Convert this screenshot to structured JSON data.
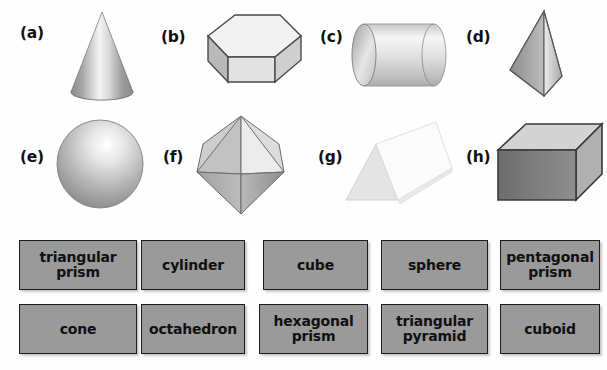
{
  "page": {
    "type": "geometry-worksheet",
    "background_color": "#fefefe",
    "title": ""
  },
  "shapes": {
    "row1": [
      {
        "letter": "(a)",
        "icon": "cone-icon",
        "shape_name": "cone",
        "shading": "vertical-gradient-grey"
      },
      {
        "letter": "(b)",
        "icon": "hexagonal-prism-icon",
        "shape_name": "hexagonal prism",
        "shading": "light-grey-faces"
      },
      {
        "letter": "(c)",
        "icon": "cylinder-icon",
        "shape_name": "cylinder",
        "shading": "horizontal-gradient-grey"
      },
      {
        "letter": "(d)",
        "icon": "triangular-pyramid-icon",
        "shape_name": "triangular pyramid",
        "shading": "two-tone-grey"
      }
    ],
    "row2": [
      {
        "letter": "(e)",
        "icon": "sphere-icon",
        "shape_name": "sphere",
        "shading": "radial-gradient-grey"
      },
      {
        "letter": "(f)",
        "icon": "octahedron-icon",
        "shape_name": "octahedron",
        "shading": "faceted-grey"
      },
      {
        "letter": "(g)",
        "icon": "triangular-prism-icon",
        "shape_name": "triangular prism",
        "shading": "near-white-faces"
      },
      {
        "letter": "(h)",
        "icon": "cuboid-icon",
        "shape_name": "cuboid",
        "shading": "dark-front-face"
      }
    ]
  },
  "answer_bank": {
    "box_fill_color": "#9a9a9a",
    "box_border_color": "#1c1c1c",
    "rows": [
      {
        "boxes": [
          {
            "label": "triangular\nprism",
            "lines": 2
          },
          {
            "label": "cylinder",
            "lines": 1
          },
          {
            "label": "cube",
            "lines": 1
          },
          {
            "label": "sphere",
            "lines": 1
          },
          {
            "label": "pentagonal\nprism",
            "lines": 2
          }
        ]
      },
      {
        "boxes": [
          {
            "label": "cone",
            "lines": 1
          },
          {
            "label": "octahedron",
            "lines": 1
          },
          {
            "label": "hexagonal\nprism",
            "lines": 2
          },
          {
            "label": "triangular\npyramid",
            "lines": 2
          },
          {
            "label": "cuboid",
            "lines": 1
          }
        ]
      }
    ]
  }
}
